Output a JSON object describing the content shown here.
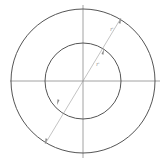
{
  "diagram": {
    "type": "concentric-circles",
    "canvas": {
      "width": 164,
      "height": 165,
      "background": "#ffffff"
    },
    "center": {
      "x": 83,
      "y": 81
    },
    "outer_circle": {
      "r": 72,
      "stroke": "#555555"
    },
    "inner_circle": {
      "r": 38,
      "stroke": "#555555"
    },
    "axes": {
      "horizontal": {
        "x1": 10,
        "x2": 160,
        "y": 81
      },
      "vertical": {
        "x": 83,
        "y1": 5,
        "y2": 158
      },
      "stroke": "#8a8a8a"
    },
    "diameter_line": {
      "x1": 121,
      "y1": 18,
      "x2": 45,
      "y2": 144,
      "stroke": "#9a9a9a"
    },
    "labels": {
      "outer_radius": "r",
      "inner_radius": "r"
    }
  }
}
